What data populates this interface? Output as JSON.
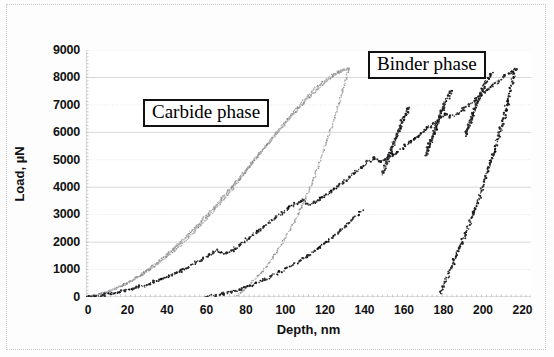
{
  "axes": {
    "x": {
      "title": "Depth, nm",
      "ticks": [
        0,
        20,
        40,
        60,
        80,
        100,
        120,
        140,
        160,
        180,
        200,
        220
      ],
      "min": 0,
      "max": 225
    },
    "y": {
      "title": "Load, µN",
      "ticks": [
        0,
        1000,
        2000,
        3000,
        4000,
        5000,
        6000,
        7000,
        8000,
        9000
      ],
      "min": 0,
      "max": 9000
    }
  },
  "annotations": [
    {
      "name": "carbide-phase-label",
      "text": "Carbide phase"
    },
    {
      "name": "binder-phase-label",
      "text": "Binder phase"
    }
  ],
  "chart_data": {
    "type": "line",
    "title": "",
    "xlabel": "Depth, nm",
    "ylabel": "Load, µN",
    "xlim": [
      0,
      225
    ],
    "ylim": [
      0,
      9000
    ],
    "grid": "horizontal-major-light",
    "legend": "none",
    "annotations": [
      {
        "text": "Carbide phase",
        "x": 45,
        "y": 6700
      },
      {
        "text": "Binder phase",
        "x": 150,
        "y": 8450
      }
    ],
    "series": [
      {
        "name": "carbide-loading-1",
        "group": "Carbide phase",
        "style": "dotted-grey",
        "points": [
          [
            0,
            0
          ],
          [
            5,
            60
          ],
          [
            12,
            230
          ],
          [
            20,
            480
          ],
          [
            28,
            780
          ],
          [
            36,
            1180
          ],
          [
            44,
            1640
          ],
          [
            52,
            2160
          ],
          [
            60,
            2760
          ],
          [
            68,
            3420
          ],
          [
            76,
            4120
          ],
          [
            84,
            4880
          ],
          [
            92,
            5600
          ],
          [
            100,
            6320
          ],
          [
            108,
            7000
          ],
          [
            116,
            7620
          ],
          [
            124,
            8060
          ],
          [
            130,
            8300
          ]
        ]
      },
      {
        "name": "carbide-loading-2",
        "group": "Carbide phase",
        "style": "dotted-grey",
        "points": [
          [
            0,
            0
          ],
          [
            6,
            70
          ],
          [
            14,
            260
          ],
          [
            22,
            540
          ],
          [
            30,
            900
          ],
          [
            38,
            1340
          ],
          [
            46,
            1840
          ],
          [
            54,
            2400
          ],
          [
            62,
            3000
          ],
          [
            70,
            3660
          ],
          [
            78,
            4340
          ],
          [
            86,
            5060
          ],
          [
            94,
            5760
          ],
          [
            102,
            6440
          ],
          [
            110,
            7080
          ],
          [
            118,
            7660
          ],
          [
            126,
            8120
          ],
          [
            132,
            8330
          ]
        ]
      },
      {
        "name": "carbide-loading-3",
        "group": "Carbide phase",
        "style": "dotted-grey",
        "points": [
          [
            0,
            0
          ],
          [
            8,
            110
          ],
          [
            16,
            330
          ],
          [
            24,
            640
          ],
          [
            32,
            1040
          ],
          [
            40,
            1500
          ],
          [
            48,
            2020
          ],
          [
            56,
            2600
          ],
          [
            64,
            3220
          ],
          [
            72,
            3880
          ],
          [
            80,
            4560
          ],
          [
            88,
            5260
          ],
          [
            96,
            5940
          ],
          [
            104,
            6600
          ],
          [
            112,
            7220
          ],
          [
            120,
            7760
          ],
          [
            127,
            8160
          ],
          [
            133,
            8330
          ]
        ]
      },
      {
        "name": "carbide-unloading",
        "group": "Carbide phase",
        "style": "dotted-grey",
        "points": [
          [
            133,
            8330
          ],
          [
            130,
            7600
          ],
          [
            127,
            6800
          ],
          [
            123,
            5950
          ],
          [
            119,
            5100
          ],
          [
            115,
            4280
          ],
          [
            110,
            3450
          ],
          [
            105,
            2700
          ],
          [
            100,
            2040
          ],
          [
            95,
            1480
          ],
          [
            90,
            1000
          ],
          [
            85,
            620
          ],
          [
            81,
            330
          ],
          [
            78,
            140
          ],
          [
            76,
            40
          ]
        ]
      },
      {
        "name": "binder-loading-1",
        "group": "Binder phase",
        "style": "dotted-black",
        "points": [
          [
            0,
            0
          ],
          [
            10,
            80
          ],
          [
            20,
            230
          ],
          [
            30,
            430
          ],
          [
            40,
            700
          ],
          [
            50,
            1020
          ],
          [
            58,
            1340
          ],
          [
            64,
            1600
          ],
          [
            66,
            1700
          ],
          [
            70,
            1560
          ],
          [
            74,
            1680
          ],
          [
            80,
            2020
          ],
          [
            88,
            2460
          ],
          [
            96,
            2900
          ],
          [
            104,
            3320
          ],
          [
            110,
            3540
          ],
          [
            112,
            3380
          ],
          [
            116,
            3460
          ],
          [
            124,
            3840
          ],
          [
            132,
            4300
          ],
          [
            140,
            4760
          ],
          [
            146,
            5080
          ],
          [
            148,
            4920
          ],
          [
            152,
            5020
          ],
          [
            160,
            5420
          ],
          [
            168,
            5880
          ],
          [
            176,
            6340
          ],
          [
            182,
            6700
          ],
          [
            184,
            6560
          ],
          [
            188,
            6680
          ],
          [
            196,
            7120
          ],
          [
            204,
            7620
          ],
          [
            212,
            8060
          ],
          [
            217,
            8320
          ]
        ]
      },
      {
        "name": "binder-popin-2",
        "group": "Binder phase",
        "style": "dotted-black",
        "points": [
          [
            150,
            4500
          ],
          [
            152,
            4900
          ],
          [
            154,
            5300
          ],
          [
            156,
            5700
          ],
          [
            158,
            6060
          ],
          [
            160,
            6420
          ],
          [
            162,
            6720
          ],
          [
            163,
            6900
          ]
        ]
      },
      {
        "name": "binder-popin-3",
        "group": "Binder phase",
        "style": "dotted-black",
        "points": [
          [
            172,
            5200
          ],
          [
            174,
            5620
          ],
          [
            176,
            6020
          ],
          [
            178,
            6420
          ],
          [
            180,
            6800
          ],
          [
            182,
            7120
          ],
          [
            184,
            7400
          ],
          [
            185,
            7540
          ]
        ]
      },
      {
        "name": "binder-popin-4",
        "group": "Binder phase",
        "style": "dotted-black",
        "points": [
          [
            192,
            5900
          ],
          [
            194,
            6320
          ],
          [
            196,
            6720
          ],
          [
            198,
            7120
          ],
          [
            200,
            7480
          ],
          [
            202,
            7800
          ],
          [
            204,
            8060
          ],
          [
            205,
            8180
          ]
        ]
      },
      {
        "name": "binder-unloading",
        "group": "Binder phase",
        "style": "dotted-black",
        "points": [
          [
            217,
            8320
          ],
          [
            215,
            7700
          ],
          [
            213,
            7050
          ],
          [
            211,
            6400
          ],
          [
            208,
            5700
          ],
          [
            205,
            5000
          ],
          [
            202,
            4320
          ],
          [
            199,
            3680
          ],
          [
            196,
            3060
          ],
          [
            193,
            2500
          ],
          [
            190,
            1980
          ],
          [
            187,
            1520
          ],
          [
            185,
            1120
          ],
          [
            183,
            760
          ],
          [
            181,
            460
          ],
          [
            180,
            240
          ],
          [
            179,
            80
          ]
        ]
      },
      {
        "name": "binder-loading-low",
        "group": "Binder phase",
        "style": "dotted-black",
        "points": [
          [
            60,
            0
          ],
          [
            70,
            120
          ],
          [
            80,
            330
          ],
          [
            90,
            620
          ],
          [
            100,
            980
          ],
          [
            110,
            1400
          ],
          [
            118,
            1800
          ],
          [
            124,
            2140
          ],
          [
            130,
            2500
          ],
          [
            136,
            2900
          ],
          [
            140,
            3180
          ]
        ]
      }
    ]
  }
}
